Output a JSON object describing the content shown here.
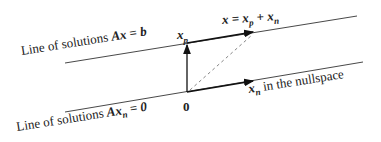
{
  "labels": {
    "top_line": "Line of solutions Ax = b",
    "bottom_line": "Line of solutions Axₙ = 0",
    "xp": "x_p",
    "x_sum": "x = x_p + x_n",
    "origin": "0",
    "xn_nullspace": "x_n in the nullspace"
  },
  "text_parts": {
    "top_line_prefix": "Line of solutions ",
    "top_line_math": "Ax = b",
    "bottom_line_prefix": "Line of solutions ",
    "bottom_line_math_A": "Ax",
    "bottom_line_sub": "n",
    "bottom_line_rhs": " = 0",
    "xp_x": "x",
    "xp_sub": "p",
    "sum_x": "x = x",
    "sum_sub_p": "p",
    "sum_plus": " + x",
    "sum_sub_n": "n",
    "origin": "0",
    "xn_x": "x",
    "xn_sub": "n",
    "xn_rest": " in the nullspace"
  }
}
